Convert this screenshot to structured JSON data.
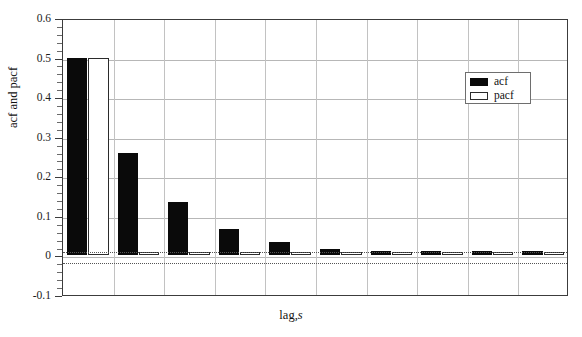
{
  "chart_data": {
    "type": "bar",
    "title": "",
    "xlabel": "lag,s",
    "xlabel_roman": "lag,",
    "xlabel_italic": "s",
    "ylabel": "acf and pacf",
    "categories": [
      "1",
      "2",
      "3",
      "4",
      "5",
      "6",
      "7",
      "8",
      "9",
      "10"
    ],
    "series": [
      {
        "name": "acf",
        "values": [
          0.5,
          0.258,
          0.135,
          0.068,
          0.033,
          0.016,
          0.012,
          0.01,
          0.01,
          0.012
        ]
      },
      {
        "name": "pacf",
        "values": [
          0.5,
          0.008,
          0.004,
          0.003,
          0.002,
          0.002,
          0.002,
          0.002,
          0.002,
          0.002
        ]
      }
    ],
    "ylim": [
      -0.1,
      0.6
    ],
    "ytick_labels": [
      "0.6",
      "0.5",
      "0.4",
      "0.3",
      "0.2",
      "0.1",
      "0",
      "-0.1"
    ],
    "ytick_values": [
      0.6,
      0.5,
      0.4,
      0.3,
      0.2,
      0.1,
      0,
      -0.1
    ],
    "yminor_step": 0.02,
    "gridlines": [
      0.5,
      0.4,
      0.3,
      0.2,
      0.1,
      0
    ],
    "grid": true,
    "confidence_bands": [
      0.014,
      -0.014
    ],
    "legend": {
      "position": "top-right",
      "entries": [
        {
          "label": "acf",
          "swatch": "filled",
          "color": "#0a0a0a"
        },
        {
          "label": "pacf",
          "swatch": "hollow",
          "color": "#ffffff"
        }
      ]
    },
    "colors": {
      "acf": "#0a0a0a",
      "pacf": "#ffffff",
      "frame": "#3c3c3c",
      "grid": "#b7b7b7",
      "confidence": "#555555"
    }
  }
}
